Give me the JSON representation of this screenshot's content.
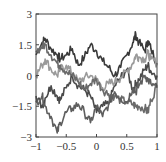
{
  "chart_data": {
    "type": "line",
    "title": "",
    "xlabel": "",
    "ylabel": "",
    "xlim": [
      -1,
      1
    ],
    "ylim": [
      -3,
      3
    ],
    "grid": false,
    "legend": null,
    "xticks": [
      "-1",
      "-0.5",
      "0",
      "0.5",
      "1"
    ],
    "yticks": [
      "3",
      "1.5",
      "0",
      "-1.5",
      "-3"
    ],
    "x": [
      -1,
      -0.9,
      -0.85,
      -0.75,
      -0.65,
      -0.6,
      -0.5,
      -0.4,
      -0.3,
      -0.2,
      -0.1,
      0,
      0.1,
      0.2,
      0.3,
      0.4,
      0.5,
      0.6,
      0.65,
      0.7,
      0.8,
      0.85,
      0.9,
      1
    ],
    "series": [
      {
        "name": "path-1",
        "color": "#3a3a3a",
        "values": [
          1.0,
          1.6,
          1.8,
          1.3,
          1.0,
          0.8,
          1.0,
          1.3,
          0.5,
          0.9,
          1.5,
          1.2,
          0.7,
          0.4,
          0.0,
          0.4,
          1.0,
          1.6,
          2.0,
          1.6,
          1.2,
          1.7,
          1.3,
          0.6
        ]
      },
      {
        "name": "path-2",
        "color": "#4a4a4a",
        "values": [
          -1.0,
          -1.5,
          -1.1,
          -0.5,
          -1.0,
          -1.2,
          -0.6,
          0.0,
          -0.5,
          -0.7,
          -1.0,
          -1.8,
          -1.5,
          -1.4,
          -0.5,
          -0.1,
          0.3,
          -0.7,
          -0.4,
          -0.2,
          0.3,
          0.5,
          0.2,
          0.0
        ]
      },
      {
        "name": "path-3",
        "color": "#9a9a9a",
        "values": [
          0.0,
          0.5,
          0.8,
          0.3,
          0.0,
          0.3,
          0.5,
          0.1,
          -0.3,
          -0.1,
          0.0,
          -0.2,
          -0.6,
          -0.4,
          -0.3,
          -0.1,
          0.2,
          0.6,
          1.0,
          0.9,
          0.8,
          1.1,
          0.8,
          0.6
        ]
      },
      {
        "name": "path-4",
        "color": "#6a6a6a",
        "values": [
          1.2,
          1.4,
          1.5,
          1.0,
          0.6,
          0.5,
          0.2,
          0.0,
          -0.3,
          -0.7,
          -0.4,
          -0.2,
          -0.7,
          -0.9,
          -1.0,
          -1.2,
          -1.3,
          -1.4,
          -1.5,
          -1.5,
          -1.6,
          -1.8,
          -1.2,
          -0.5
        ]
      },
      {
        "name": "path-5",
        "color": "#5e5e5e",
        "values": [
          -1.3,
          -1.0,
          -1.5,
          -2.0,
          -2.8,
          -2.3,
          -1.8,
          -1.6,
          -1.4,
          -1.8,
          -2.3,
          -1.5,
          -2.0,
          -1.4,
          -0.8,
          -1.1,
          -1.3,
          -0.6,
          -0.8,
          -0.5,
          0.0,
          -0.2,
          -0.4,
          -0.6
        ]
      }
    ]
  }
}
